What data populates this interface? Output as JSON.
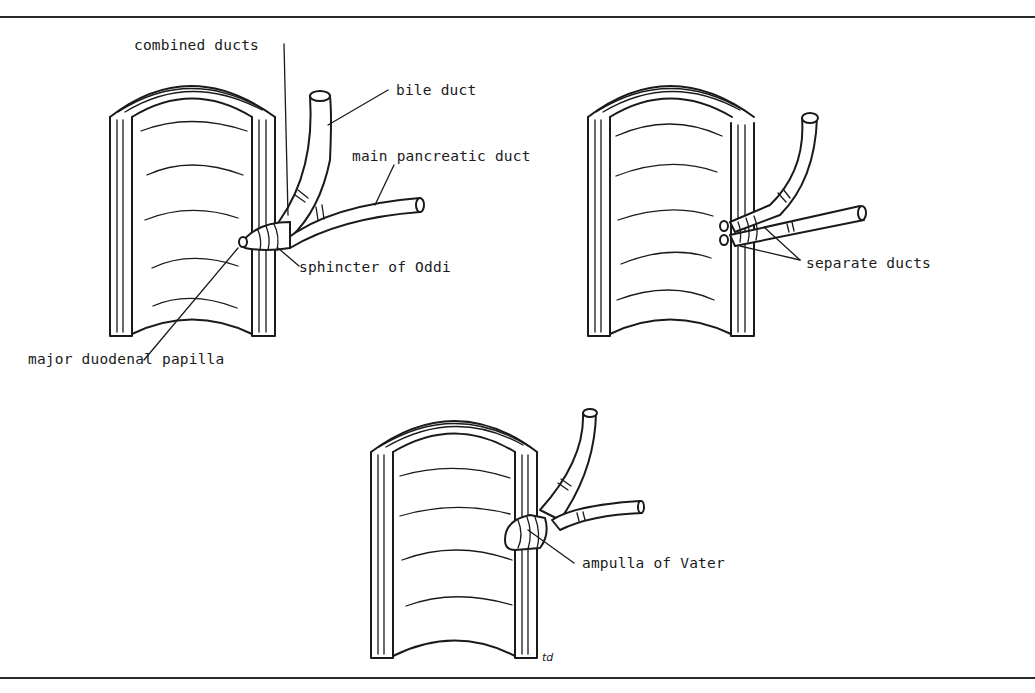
{
  "figure": {
    "panels": [
      {
        "id": "combined",
        "labels": {
          "combined_ducts": "combined ducts",
          "bile_duct": "bile duct",
          "main_pancreatic_duct": "main pancreatic duct",
          "sphincter": "sphincter of Oddi",
          "papilla": "major duodenal papilla"
        }
      },
      {
        "id": "separate",
        "labels": {
          "separate_ducts": "separate ducts"
        }
      },
      {
        "id": "ampulla",
        "labels": {
          "ampulla": "ampulla of Vater"
        }
      }
    ],
    "signature": "td"
  },
  "colors": {
    "ink": "#1a1a1a",
    "background": "#ffffff"
  }
}
